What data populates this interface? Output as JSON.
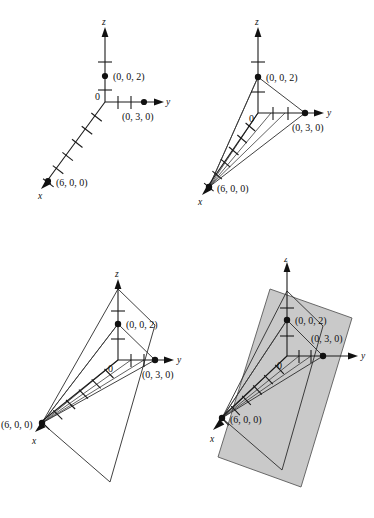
{
  "figure": {
    "caption": "",
    "background_color": "#ffffff",
    "ink_color": "#111111",
    "plane_fill_color": "#c9c9c9",
    "plane_edge_color": "#5a5a5a"
  },
  "axes": {
    "z_label": "z",
    "y_label": "y",
    "x_label": "x",
    "origin_label": "0",
    "z_ticks": 2,
    "y_ticks": 2,
    "x_ticks": 6
  },
  "points": [
    {
      "id": "z-intercept",
      "label": "(0, 0, 2)",
      "coords": [
        0,
        0,
        2
      ]
    },
    {
      "id": "y-intercept",
      "label": "(0, 3, 0)",
      "coords": [
        0,
        3,
        0
      ]
    },
    {
      "id": "x-intercept",
      "label": "(6, 0, 0)",
      "coords": [
        6,
        0,
        0
      ]
    }
  ],
  "panels": [
    {
      "id": "panel-a",
      "position": "top-left",
      "step": "Plot the three intercepts on the axes",
      "shows_triangle": false,
      "shows_plane": false,
      "labels": {
        "z_axis": "z",
        "y_axis": "y",
        "x_axis": "x",
        "origin": "0",
        "z_point": "(0, 0, 2)",
        "y_point": "(0, 3, 0)",
        "x_point": "(6, 0, 0)"
      }
    },
    {
      "id": "panel-b",
      "position": "top-right",
      "step": "Join the intercepts to form the trace triangle",
      "shows_triangle": true,
      "shows_plane": false,
      "labels": {
        "z_axis": "z",
        "y_axis": "y",
        "x_axis": "x",
        "origin": "0",
        "z_point": "(0, 0, 2)",
        "y_point": "(0, 3, 0)",
        "x_point": "(6, 0, 0)"
      }
    },
    {
      "id": "panel-c",
      "position": "bottom-left",
      "step": "Extend the triangle edges to outline the plane region",
      "shows_triangle": true,
      "shows_plane": false,
      "labels": {
        "z_axis": "z",
        "y_axis": "y",
        "x_axis": "x",
        "origin": "0",
        "z_point": "(0, 0, 2)",
        "y_point": "(0, 3, 0)",
        "x_point": "(6, 0, 0)"
      }
    },
    {
      "id": "panel-d",
      "position": "bottom-right",
      "step": "Shade the portion of the plane",
      "shows_triangle": true,
      "shows_plane": true,
      "labels": {
        "z_axis": "z",
        "y_axis": "y",
        "x_axis": "x",
        "origin": "0",
        "z_point": "(0, 0, 2)",
        "y_point": "(0, 3, 0)",
        "x_point": "(6, 0, 0)"
      }
    }
  ]
}
